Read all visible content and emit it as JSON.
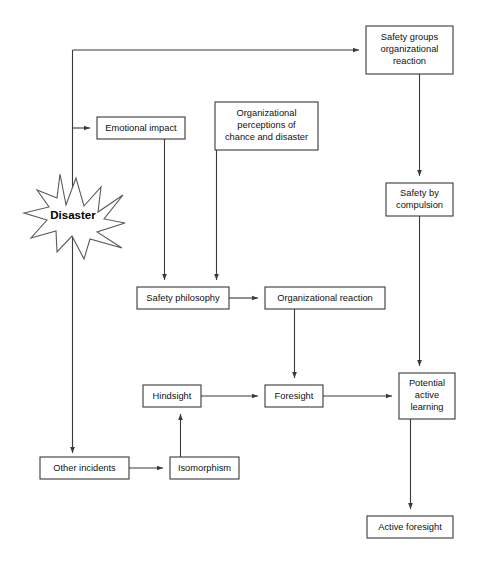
{
  "diagram": {
    "type": "flowchart",
    "background_color": "#ffffff",
    "line_color": "#3a3a3a",
    "box_fill": "#ffffff",
    "nodes": [
      {
        "id": "safety-groups",
        "shape": "rect",
        "lines": [
          "Safety groups",
          "organizational",
          "reaction"
        ],
        "x": 366,
        "y": 26,
        "w": 87,
        "h": 48
      },
      {
        "id": "emotional-impact",
        "shape": "rect",
        "lines": [
          "Emotional impact"
        ],
        "x": 97,
        "y": 117,
        "w": 88,
        "h": 22
      },
      {
        "id": "organizational-perceptions",
        "shape": "rect",
        "lines": [
          "Organizational",
          "perceptions of",
          "chance and disaster"
        ],
        "x": 215,
        "y": 102,
        "w": 103,
        "h": 48
      },
      {
        "id": "disaster",
        "shape": "starburst",
        "lines": [
          "Disaster"
        ],
        "x": 24,
        "y": 174,
        "w": 101,
        "h": 85
      },
      {
        "id": "safety-by-compulsion",
        "shape": "rect",
        "lines": [
          "Safety by",
          "compulsion"
        ],
        "x": 386,
        "y": 183,
        "w": 67,
        "h": 33
      },
      {
        "id": "safety-philosophy",
        "shape": "rect",
        "lines": [
          "Safety philosophy"
        ],
        "x": 137,
        "y": 287,
        "w": 92,
        "h": 22
      },
      {
        "id": "organizational-reaction",
        "shape": "rect",
        "lines": [
          "Organizational reaction"
        ],
        "x": 265,
        "y": 287,
        "w": 120,
        "h": 22
      },
      {
        "id": "hindsight",
        "shape": "rect",
        "lines": [
          "Hindsight"
        ],
        "x": 143,
        "y": 385,
        "w": 58,
        "h": 22
      },
      {
        "id": "foresight",
        "shape": "rect",
        "lines": [
          "Foresight"
        ],
        "x": 265,
        "y": 385,
        "w": 58,
        "h": 22
      },
      {
        "id": "potential-active-learning",
        "shape": "rect",
        "lines": [
          "Potential",
          "active",
          "learning"
        ],
        "x": 399,
        "y": 373,
        "w": 56,
        "h": 46
      },
      {
        "id": "other-incidents",
        "shape": "rect",
        "lines": [
          "Other incidents"
        ],
        "x": 40,
        "y": 457,
        "w": 89,
        "h": 22
      },
      {
        "id": "isomorphism",
        "shape": "rect",
        "lines": [
          "Isomorphism"
        ],
        "x": 170,
        "y": 457,
        "w": 69,
        "h": 22
      },
      {
        "id": "active-foresight",
        "shape": "rect",
        "lines": [
          "Active foresight"
        ],
        "x": 367,
        "y": 516,
        "w": 86,
        "h": 22
      }
    ],
    "edges": [
      {
        "id": "trunk-to-safety-groups",
        "from": "disaster-trunk",
        "to": "safety-groups",
        "path": "M 72 50 L 410 50",
        "arrow": "right",
        "arrow_at": [
          366,
          50
        ]
      },
      {
        "id": "trunk-vertical-top",
        "from": "disaster-trunk",
        "to": "trunk-top",
        "path": "M 72 50 L 72 455",
        "arrow": "none"
      },
      {
        "id": "trunk-to-emotional-impact",
        "from": "disaster-trunk",
        "to": "emotional-impact",
        "path": "M 72 128 L 97 128",
        "arrow": "right",
        "arrow_at": [
          97,
          128
        ]
      },
      {
        "id": "trunk-to-other-incidents",
        "from": "disaster-trunk",
        "to": "other-incidents",
        "path": "M 72 128 L 72 457",
        "arrow": "down",
        "arrow_at": [
          72,
          457
        ]
      },
      {
        "id": "safety-groups-to-compulsion",
        "from": "safety-groups",
        "to": "safety-by-compulsion",
        "path": "M 419 74 L 419 183",
        "arrow": "down",
        "arrow_at": [
          419,
          183
        ]
      },
      {
        "id": "compulsion-to-potential",
        "from": "safety-by-compulsion",
        "to": "potential-active-learning",
        "path": "M 419 216 L 419 373",
        "arrow": "down",
        "arrow_at": [
          419,
          373
        ]
      },
      {
        "id": "emotional-to-philosophy",
        "from": "emotional-impact",
        "to": "safety-philosophy",
        "path": "M 164 139 L 164 287",
        "arrow": "down",
        "arrow_at": [
          164,
          287
        ]
      },
      {
        "id": "perceptions-to-philosophy",
        "from": "organizational-perceptions",
        "to": "safety-philosophy",
        "path": "M 216 150 L 216 287",
        "arrow": "down",
        "arrow_at": [
          216,
          287
        ]
      },
      {
        "id": "philosophy-to-org-reaction",
        "from": "safety-philosophy",
        "to": "organizational-reaction",
        "path": "M 229 298 L 265 298",
        "arrow": "right",
        "arrow_at": [
          265,
          298
        ]
      },
      {
        "id": "org-reaction-to-foresight",
        "from": "organizational-reaction",
        "to": "foresight",
        "path": "M 294 309 L 294 385",
        "arrow": "down",
        "arrow_at": [
          294,
          385
        ]
      },
      {
        "id": "hindsight-to-foresight",
        "from": "hindsight",
        "to": "foresight",
        "path": "M 201 396 L 265 396",
        "arrow": "right",
        "arrow_at": [
          265,
          396
        ]
      },
      {
        "id": "foresight-to-potential",
        "from": "foresight",
        "to": "potential-active-learning",
        "path": "M 323 396 L 399 396",
        "arrow": "right",
        "arrow_at": [
          399,
          396
        ]
      },
      {
        "id": "other-incidents-to-isomorphism",
        "from": "other-incidents",
        "to": "isomorphism",
        "path": "M 129 468 L 170 468",
        "arrow": "right",
        "arrow_at": [
          170,
          468
        ]
      },
      {
        "id": "isomorphism-to-hindsight",
        "from": "isomorphism",
        "to": "hindsight",
        "path": "M 180 457 L 180 407",
        "arrow": "up",
        "arrow_at": [
          180,
          407
        ]
      },
      {
        "id": "potential-to-active-foresight",
        "from": "potential-active-learning",
        "to": "active-foresight",
        "path": "M 410 419 L 410 516",
        "arrow": "down",
        "arrow_at": [
          410,
          516
        ]
      }
    ]
  }
}
